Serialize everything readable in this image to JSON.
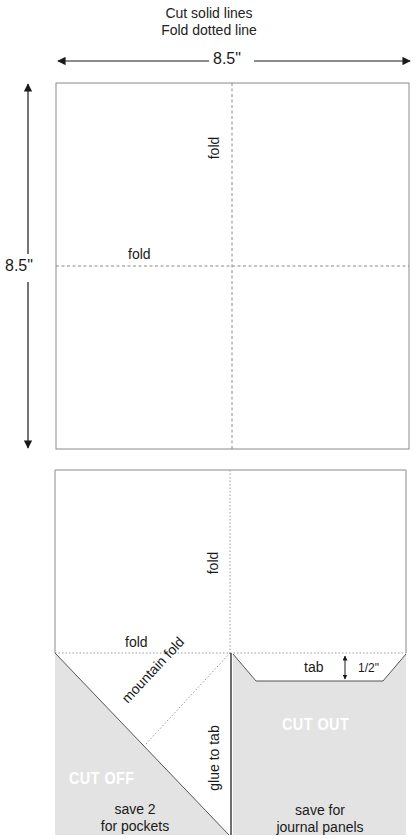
{
  "header": {
    "line1": "Cut solid lines",
    "line2": "Fold dotted line"
  },
  "dimensions": {
    "width_label": "8.5\"",
    "height_label": "8.5\""
  },
  "upper_square": {
    "fold_vertical_label": "fold",
    "fold_horizontal_label": "fold"
  },
  "lower_piece": {
    "fold_vertical_label": "fold",
    "fold_horizontal_label": "fold",
    "mountain_fold_label": "mountain fold",
    "glue_label": "glue to tab",
    "tab_label": "tab",
    "tab_height_label": "1/2\"",
    "cut_off_stamp": "CUT OFF",
    "cut_off_note_line1": "save 2",
    "cut_off_note_line2": "for pockets",
    "cut_out_stamp": "CUT OUT",
    "cut_out_note_line1": "save for",
    "cut_out_note_line2": "journal panels"
  },
  "colors": {
    "cut_line": "#8a8a8a",
    "fold_line": "#8a8a8a",
    "shaded_region": "#e3e3e3",
    "arrow": "#1a1a1a",
    "stamp_text": "#ffffff"
  }
}
